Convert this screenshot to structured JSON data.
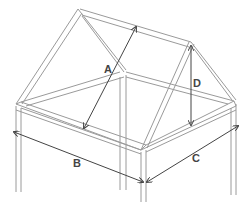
{
  "diagram": {
    "labels": {
      "a": "A",
      "b": "B",
      "c": "C",
      "d": "D"
    },
    "colors": {
      "line": "#8a8a8a",
      "dark": "#555555",
      "background": "#ffffff"
    }
  }
}
